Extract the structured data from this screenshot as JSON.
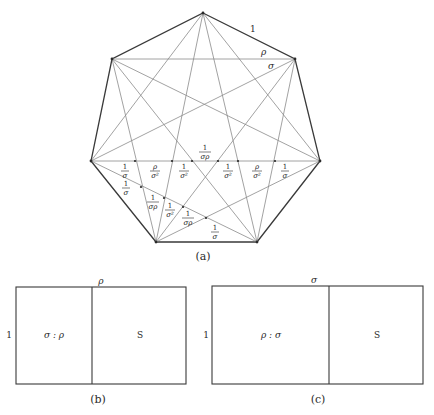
{
  "figure_a": {
    "caption": "(a)",
    "vertices": [
      {
        "x": 203,
        "y": 13
      },
      {
        "x": 295,
        "y": 59
      },
      {
        "x": 320,
        "y": 161
      },
      {
        "x": 257,
        "y": 242
      },
      {
        "x": 156,
        "y": 242
      },
      {
        "x": 91,
        "y": 161
      },
      {
        "x": 112,
        "y": 59
      }
    ],
    "edge_labels": {
      "side": "1",
      "short_diagonal": "ρ",
      "long_diagonal": "σ"
    },
    "horizontal_segment_labels": [
      {
        "num": "1",
        "den": "σ"
      },
      {
        "num": "ρ",
        "den": "σ²"
      },
      {
        "num": "1",
        "den": "σ²"
      },
      {
        "num": "1",
        "den": "σρ"
      },
      {
        "num": "1",
        "den": "σ²"
      },
      {
        "num": "ρ",
        "den": "σ²"
      },
      {
        "num": "1",
        "den": "σ"
      }
    ],
    "oblique_segment_labels": [
      {
        "num": "1",
        "den": "σ"
      },
      {
        "num": "1",
        "den": "σρ"
      },
      {
        "num": "1",
        "den": "σ²"
      },
      {
        "num": "1",
        "den": "σρ"
      },
      {
        "num": "1",
        "den": "σ"
      }
    ]
  },
  "figure_b": {
    "caption": "(b)",
    "top_label": "ρ",
    "side_label": "1",
    "left_cell_label": "σ : ρ",
    "right_cell_label": "S"
  },
  "figure_c": {
    "caption": "(c)",
    "top_label": "σ",
    "side_label": "1",
    "left_cell_label": "ρ : σ",
    "right_cell_label": "S"
  }
}
